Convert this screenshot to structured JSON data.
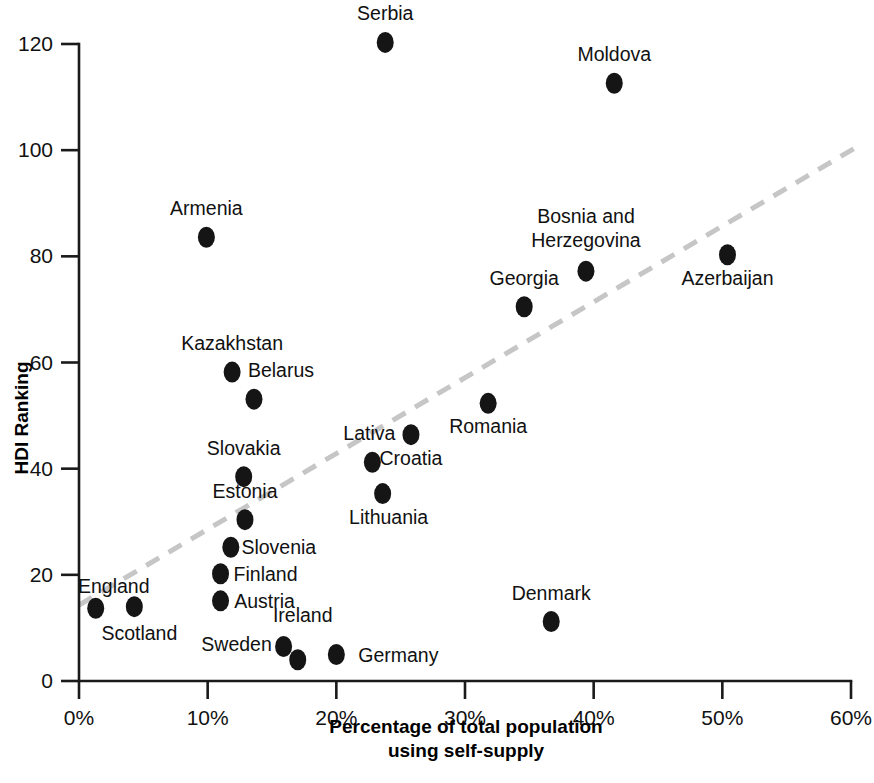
{
  "chart_data": {
    "type": "scatter",
    "title": "",
    "xlabel": "Percentage of total population using self-supply",
    "xlabel_line1": "Percentage of total population",
    "xlabel_line2": "using self-supply",
    "ylabel": "HDI Ranking",
    "xlim": [
      0,
      60
    ],
    "ylim": [
      0,
      120
    ],
    "xticks": [
      0,
      10,
      20,
      30,
      40,
      50,
      60
    ],
    "xtick_labels": [
      "0%",
      "10%",
      "20%",
      "30%",
      "40%",
      "50%",
      "60%"
    ],
    "yticks": [
      0,
      20,
      40,
      60,
      80,
      100,
      120
    ],
    "ytick_labels": [
      "0",
      "20",
      "40",
      "60",
      "80",
      "100",
      "120"
    ],
    "grid": false,
    "legend": "none",
    "point_color": "#151515",
    "trendline_color": "#c6c6c6",
    "axis_color": "#1a1a1a",
    "trendline": {
      "style": "dashed",
      "x_start": 0,
      "y_start": 14.3,
      "x_end": 60.3,
      "y_end": 100.4
    },
    "points": [
      {
        "label": "Serbia",
        "x": 23.8,
        "y": 120.3,
        "label_dx": 0,
        "label_dy": -22
      },
      {
        "label": "Moldova",
        "x": 41.6,
        "y": 112.6,
        "label_dx": 0,
        "label_dy": -22
      },
      {
        "label": "Armenia",
        "x": 9.9,
        "y": 83.6,
        "label_dx": 0,
        "label_dy": -22
      },
      {
        "label": "Bosnia and Herzegovina",
        "x": 39.4,
        "y": 77.2,
        "label_dx": 0,
        "label_dy": -48
      },
      {
        "label": "Azerbaijan",
        "x": 50.4,
        "y": 80.3,
        "label_dx": 0,
        "label_dy": 30
      },
      {
        "label": "Georgia",
        "x": 34.6,
        "y": 70.5,
        "label_dx": 0,
        "label_dy": -22
      },
      {
        "label": "Kazakhstan",
        "x": 11.9,
        "y": 58.2,
        "label_dx": 0,
        "label_dy": -22
      },
      {
        "label": "Belarus",
        "x": 13.6,
        "y": 53.1,
        "label_dx": 27,
        "label_dy": -22
      },
      {
        "label": "Romania",
        "x": 31.8,
        "y": 52.3,
        "label_dx": 0,
        "label_dy": 30
      },
      {
        "label": "Croatia",
        "x": 25.8,
        "y": 46.4,
        "label_dx": 0,
        "label_dy": 30
      },
      {
        "label": "Lativa",
        "x": 22.8,
        "y": 41.2,
        "label_dx": -3,
        "label_dy": -22
      },
      {
        "label": "Slovakia",
        "x": 12.8,
        "y": 38.5,
        "label_dx": 0,
        "label_dy": -22
      },
      {
        "label": "Lithuania",
        "x": 23.6,
        "y": 35.3,
        "label_dx": 6,
        "label_dy": 30
      },
      {
        "label": "Estonia",
        "x": 12.9,
        "y": 30.4,
        "label_dx": 0,
        "label_dy": -22
      },
      {
        "label": "Slovenia",
        "x": 11.8,
        "y": 25.2,
        "label_dx": 48,
        "label_dy": 7
      },
      {
        "label": "Finland",
        "x": 11.0,
        "y": 20.2,
        "label_dx": 45,
        "label_dy": 7
      },
      {
        "label": "England",
        "x": 1.3,
        "y": 13.7,
        "label_dx": 18,
        "label_dy": -15
      },
      {
        "label": "Austria",
        "x": 11.0,
        "y": 15.1,
        "label_dx": 44,
        "label_dy": 7
      },
      {
        "label": "Scotland",
        "x": 4.3,
        "y": 14.0,
        "label_dx": 5,
        "label_dy": 33
      },
      {
        "label": "Denmark",
        "x": 36.7,
        "y": 11.2,
        "label_dx": 0,
        "label_dy": -22
      },
      {
        "label": "Sweden",
        "x": 15.9,
        "y": 6.5,
        "label_dx": -47,
        "label_dy": 5
      },
      {
        "label": "Ireland",
        "x": 17.0,
        "y": 4.0,
        "label_dx": 5,
        "label_dy": -38
      },
      {
        "label": "Germany",
        "x": 20.0,
        "y": 5.0,
        "label_dx": 62,
        "label_dy": 8
      }
    ]
  }
}
